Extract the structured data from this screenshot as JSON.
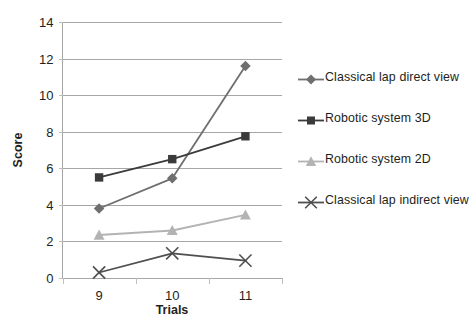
{
  "chart_data": {
    "type": "line",
    "title": "",
    "subtitle": "",
    "xlabel": "Trials",
    "ylabel": "Score",
    "categories": [
      "9",
      "10",
      "11"
    ],
    "x": [
      9,
      10,
      11
    ],
    "ylim": [
      0,
      14
    ],
    "ytick_values": [
      0,
      2,
      4,
      6,
      8,
      10,
      12,
      14
    ],
    "ytick_labels": [
      "0",
      "2",
      "4",
      "6",
      "8",
      "10",
      "12",
      "14"
    ],
    "ytick_step": 2,
    "grid": "horizontal",
    "legend_position": "right",
    "series": [
      {
        "name": "Classical lap direct view",
        "values": [
          3.8,
          5.45,
          11.6
        ],
        "color": "#6f6f6f",
        "marker": "diamond"
      },
      {
        "name": "Robotic system 3D",
        "values": [
          5.5,
          6.5,
          7.75
        ],
        "color": "#3b3b3b",
        "marker": "square"
      },
      {
        "name": "Robotic system 2D",
        "values": [
          2.35,
          2.6,
          3.45
        ],
        "color": "#b3b3b3",
        "marker": "triangle"
      },
      {
        "name": "Classical lap indirect view",
        "values": [
          0.3,
          1.35,
          0.95
        ],
        "color": "#4f4f4f",
        "marker": "x"
      }
    ]
  },
  "legend": {
    "entries": [
      {
        "label": "Classical lap direct view"
      },
      {
        "label": "Robotic system 3D"
      },
      {
        "label": "Robotic system 2D"
      },
      {
        "label": "Classical lap indirect view"
      }
    ]
  },
  "colors": {
    "background": "#ffffff",
    "gridline": "#a6a6a6",
    "text": "#231f20",
    "series_direct": "#6f6f6f",
    "series_3d": "#3b3b3b",
    "series_2d": "#b3b3b3",
    "series_indirect": "#4f4f4f"
  }
}
